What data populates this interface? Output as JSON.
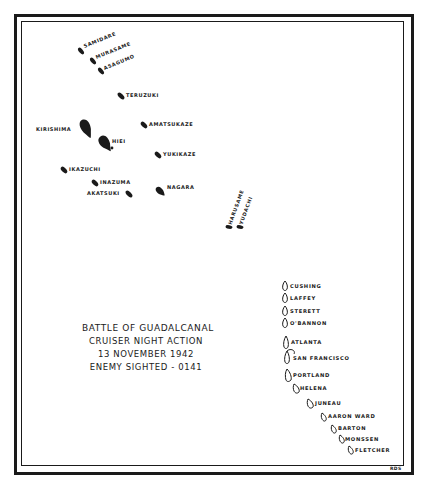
{
  "title": {
    "lines": [
      "BATTLE OF GUADALCANAL",
      "CRUISER NIGHT ACTION",
      "13 NOVEMBER 1942",
      "ENEMY SIGHTED - 0141"
    ]
  },
  "initials": "RDS",
  "japanese_ships": [
    {
      "name": "SAMIDARE"
    },
    {
      "name": "MURASAME"
    },
    {
      "name": "ASAGUMO"
    },
    {
      "name": "TERUZUKI"
    },
    {
      "name": "KIRISHIMA"
    },
    {
      "name": "HIEI"
    },
    {
      "name": "AMATSUKAZE"
    },
    {
      "name": "YUKIKAZE"
    },
    {
      "name": "IKAZUCHI"
    },
    {
      "name": "INAZUMA"
    },
    {
      "name": "AKATSUKI"
    },
    {
      "name": "NAGARA"
    },
    {
      "name": "HARUSAME"
    },
    {
      "name": "YUDACHI"
    }
  ],
  "us_ships": [
    {
      "name": "CUSHING"
    },
    {
      "name": "LAFFEY"
    },
    {
      "name": "STERETT"
    },
    {
      "name": "O'BANNON"
    },
    {
      "name": "ATLANTA"
    },
    {
      "name": "SAN FRANCISCO"
    },
    {
      "name": "PORTLAND"
    },
    {
      "name": "HELENA"
    },
    {
      "name": "JUNEAU"
    },
    {
      "name": "AARON WARD"
    },
    {
      "name": "BARTON"
    },
    {
      "name": "MONSSEN"
    },
    {
      "name": "FLETCHER"
    }
  ],
  "colors": {
    "ink": "#1a1a1a",
    "paper": "#ffffff"
  }
}
